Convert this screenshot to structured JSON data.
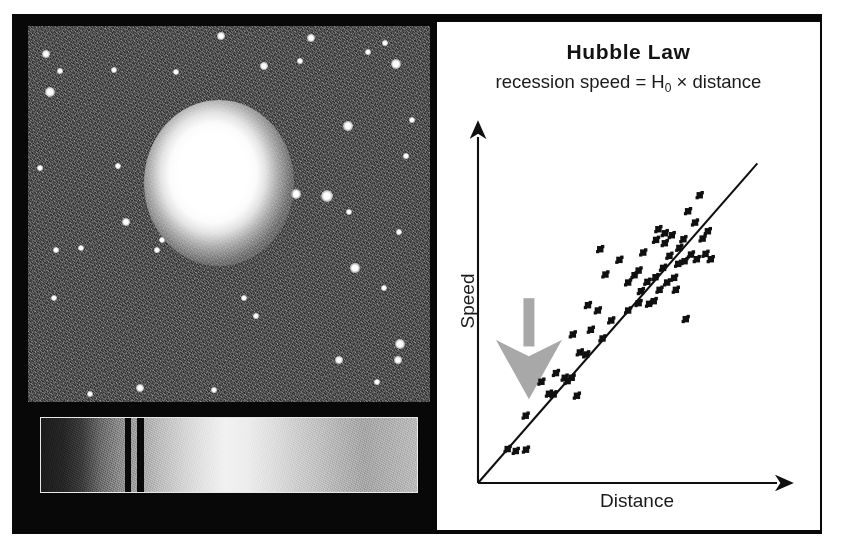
{
  "figure": {
    "kind": "astronomy-figure",
    "frame_color": "#080808",
    "panel_background": "#ffffff"
  },
  "galaxy_image": {
    "name": "elliptical-galaxy-photograph",
    "description": "Grayscale telescope image of a bright elliptical galaxy in a noisy star field",
    "background_color": "#4d4d4d",
    "core_color": "#ffffff",
    "stars": [
      {
        "x": 18,
        "y": 28,
        "r": 3.2
      },
      {
        "x": 32,
        "y": 45,
        "r": 2.2
      },
      {
        "x": 22,
        "y": 66,
        "r": 4.0
      },
      {
        "x": 86,
        "y": 44,
        "r": 2.6
      },
      {
        "x": 148,
        "y": 46,
        "r": 2.4
      },
      {
        "x": 193,
        "y": 10,
        "r": 3.4
      },
      {
        "x": 236,
        "y": 40,
        "r": 2.8
      },
      {
        "x": 272,
        "y": 35,
        "r": 2.0
      },
      {
        "x": 283,
        "y": 12,
        "r": 3.0
      },
      {
        "x": 340,
        "y": 26,
        "r": 2.2
      },
      {
        "x": 357,
        "y": 17,
        "r": 2.0
      },
      {
        "x": 368,
        "y": 38,
        "r": 3.8
      },
      {
        "x": 320,
        "y": 100,
        "r": 3.6
      },
      {
        "x": 384,
        "y": 94,
        "r": 2.2
      },
      {
        "x": 378,
        "y": 130,
        "r": 2.0
      },
      {
        "x": 90,
        "y": 140,
        "r": 2.2
      },
      {
        "x": 12,
        "y": 142,
        "r": 2.0
      },
      {
        "x": 268,
        "y": 168,
        "r": 4.0
      },
      {
        "x": 299,
        "y": 170,
        "r": 4.6
      },
      {
        "x": 321,
        "y": 186,
        "r": 2.4
      },
      {
        "x": 371,
        "y": 206,
        "r": 2.2
      },
      {
        "x": 98,
        "y": 196,
        "r": 3.4
      },
      {
        "x": 53,
        "y": 222,
        "r": 2.6
      },
      {
        "x": 28,
        "y": 224,
        "r": 2.2
      },
      {
        "x": 134,
        "y": 214,
        "r": 2.6
      },
      {
        "x": 129,
        "y": 224,
        "r": 2.2
      },
      {
        "x": 327,
        "y": 242,
        "r": 3.6
      },
      {
        "x": 356,
        "y": 262,
        "r": 2.4
      },
      {
        "x": 26,
        "y": 272,
        "r": 2.6
      },
      {
        "x": 216,
        "y": 272,
        "r": 2.4
      },
      {
        "x": 228,
        "y": 290,
        "r": 2.0
      },
      {
        "x": 372,
        "y": 318,
        "r": 4.2
      },
      {
        "x": 370,
        "y": 334,
        "r": 2.8
      },
      {
        "x": 311,
        "y": 334,
        "r": 3.4
      },
      {
        "x": 112,
        "y": 362,
        "r": 3.2
      },
      {
        "x": 186,
        "y": 364,
        "r": 2.2
      },
      {
        "x": 62,
        "y": 368,
        "r": 2.4
      },
      {
        "x": 349,
        "y": 356,
        "r": 2.2
      }
    ]
  },
  "spectrum_image": {
    "name": "galaxy-spectrum-strip",
    "description": "Grayscale spectrum of the galaxy showing two dark absorption lines",
    "absorption_lines": [
      {
        "x": 84,
        "width": 6
      },
      {
        "x": 96,
        "width": 7
      }
    ]
  },
  "chart_data": {
    "type": "scatter",
    "title": "Hubble Law",
    "subtitle_prefix": "recession speed = H",
    "subtitle_subscript": "0",
    "subtitle_suffix": " × distance",
    "xlabel": "Distance",
    "ylabel": "Speed",
    "grid": false,
    "legend": null,
    "xlim": [
      0,
      10
    ],
    "ylim": [
      0,
      10
    ],
    "axis_style": "arrow-headed, unlabeled ticks",
    "trendline": {
      "description": "best-fit line through origin",
      "x": [
        0,
        9.6
      ],
      "y": [
        0,
        9.6
      ],
      "color": "#101010"
    },
    "annotation": {
      "name": "gray-down-arrow",
      "label": "",
      "color": "#a8a8a8",
      "points_to": "low-distance low-speed data point",
      "x": 1.75,
      "y": 4.1
    },
    "points": [
      [
        1.02,
        1.02
      ],
      [
        1.3,
        0.96
      ],
      [
        1.65,
        1.0
      ],
      [
        1.64,
        2.02
      ],
      [
        2.18,
        3.04
      ],
      [
        2.44,
        2.68
      ],
      [
        2.6,
        2.66
      ],
      [
        2.68,
        3.3
      ],
      [
        2.98,
        3.16
      ],
      [
        3.08,
        3.06
      ],
      [
        3.22,
        3.16
      ],
      [
        3.4,
        2.62
      ],
      [
        3.5,
        3.92
      ],
      [
        3.72,
        3.86
      ],
      [
        3.26,
        4.46
      ],
      [
        3.88,
        4.6
      ],
      [
        4.12,
        5.18
      ],
      [
        3.78,
        5.34
      ],
      [
        4.28,
        4.34
      ],
      [
        4.38,
        6.26
      ],
      [
        4.58,
        4.88
      ],
      [
        4.86,
        6.7
      ],
      [
        5.16,
        5.18
      ],
      [
        5.16,
        6.02
      ],
      [
        5.38,
        6.24
      ],
      [
        5.52,
        5.4
      ],
      [
        5.52,
        6.38
      ],
      [
        5.6,
        5.76
      ],
      [
        5.68,
        6.92
      ],
      [
        5.82,
        6.04
      ],
      [
        5.88,
        5.38
      ],
      [
        6.04,
        5.46
      ],
      [
        6.1,
        6.18
      ],
      [
        6.12,
        7.3
      ],
      [
        6.2,
        7.62
      ],
      [
        6.24,
        5.8
      ],
      [
        6.36,
        6.46
      ],
      [
        6.42,
        7.2
      ],
      [
        6.42,
        7.5
      ],
      [
        6.5,
        6.02
      ],
      [
        6.58,
        6.82
      ],
      [
        6.66,
        7.44
      ],
      [
        6.74,
        6.16
      ],
      [
        6.8,
        5.8
      ],
      [
        6.88,
        6.58
      ],
      [
        6.92,
        7.06
      ],
      [
        7.06,
        7.32
      ],
      [
        7.1,
        6.66
      ],
      [
        7.14,
        4.92
      ],
      [
        7.22,
        8.16
      ],
      [
        7.32,
        6.86
      ],
      [
        7.46,
        7.82
      ],
      [
        7.52,
        6.72
      ],
      [
        7.62,
        8.64
      ],
      [
        7.72,
        7.34
      ],
      [
        7.82,
        6.88
      ],
      [
        7.9,
        7.56
      ],
      [
        4.2,
        7.02
      ],
      [
        8.0,
        6.72
      ]
    ]
  }
}
